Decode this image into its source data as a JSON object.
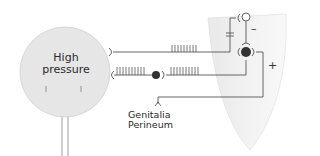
{
  "diagram": {
    "type": "neural reflex diagram",
    "nodes": {
      "bladder": {
        "label_line1": "High",
        "label_line2": "pressure",
        "color": "#e6e6e6"
      },
      "spinal_cord": {
        "color": "#efefef"
      },
      "genitalia": {
        "label_line1": "Genitalia",
        "label_line2": "Perineum"
      }
    },
    "signs": {
      "inhibitory": "–",
      "excitatory": "+"
    },
    "colors": {
      "line": "#555555",
      "neuron_filled": "#333333",
      "neuron_open": "#ffffff"
    }
  }
}
